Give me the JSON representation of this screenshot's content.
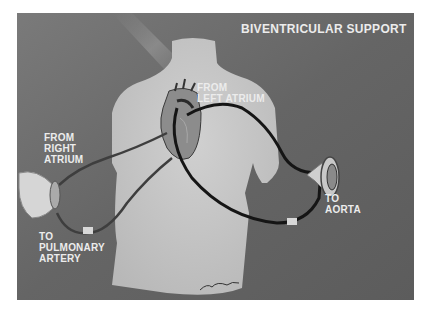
{
  "figure": {
    "title": "BIVENTRICULAR  SUPPORT",
    "labels": {
      "from_left_atrium": "FROM\nLEFT ATRIUM",
      "from_right_atrium": "FROM\nRIGHT\nATRIUM",
      "to_pulmonary_artery": "TO\nPULMONARY\nARTERY",
      "to_aorta": "TO\nAORTA"
    },
    "colors": {
      "background": "#6a6a6a",
      "torso": "#c4c4c4",
      "text": "#ececec",
      "cannula_dark": "#1a1a1a",
      "cannula_red": "#4a4a4a"
    }
  }
}
